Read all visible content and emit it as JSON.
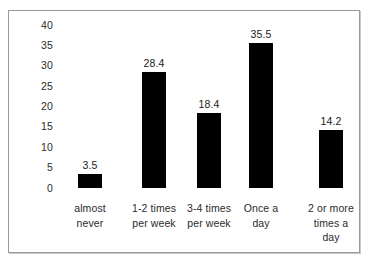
{
  "chart_data": {
    "type": "bar",
    "title": "",
    "subtitle": "",
    "xlabel": "",
    "ylabel": "",
    "categories": [
      "almost never",
      "1-2 times per week",
      "3-4 times per week",
      "Once a day",
      "2 or more times a day"
    ],
    "category_lines": [
      [
        "almost",
        "never"
      ],
      [
        "1-2 times",
        "per week"
      ],
      [
        "3-4 times",
        "per week"
      ],
      [
        "Once a",
        "day"
      ],
      [
        "2 or more",
        "times a",
        "day"
      ]
    ],
    "values": [
      3.5,
      28.4,
      18.4,
      35.5,
      14.2
    ],
    "value_labels": [
      "3.5",
      "28.4",
      "18.4",
      "35.5",
      "14.2"
    ],
    "ylim": [
      0,
      40
    ],
    "ytick_values": [
      40,
      35,
      30,
      25,
      20,
      15,
      10,
      5,
      0
    ],
    "ytick_labels": [
      "40",
      "35",
      "30",
      "25",
      "20",
      "15",
      "10",
      "5",
      "0"
    ],
    "grid": false,
    "legend": null,
    "legend_position": "none",
    "bar_color": "#000000",
    "background_color": "#ffffff",
    "border_color": "#9a9a9a",
    "text_color": "#2b2b2b"
  }
}
